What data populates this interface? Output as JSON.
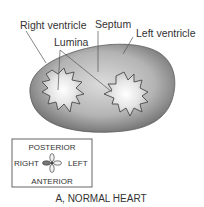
{
  "labels": {
    "right_ventricle": "Right ventricle",
    "septum": "Septum",
    "left_ventricle": "Left ventricle",
    "lumina": "Lumina"
  },
  "orientation": {
    "posterior": "POSTERIOR",
    "anterior": "ANTERIOR",
    "right": "RIGHT",
    "left": "LEFT"
  },
  "caption": "A, NORMAL HEART",
  "colors": {
    "text": "#333333",
    "outline": "#4a4a4a",
    "body_dark": "#6e6e6e",
    "body_light": "#d8d8d8"
  }
}
